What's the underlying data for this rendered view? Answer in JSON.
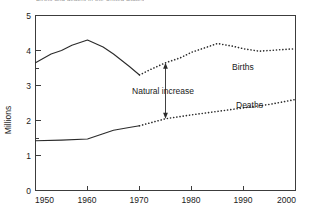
{
  "figure": {
    "cut_off_caption": "Births and deaths in the United States",
    "ylabel": "Millions"
  },
  "annotations": {
    "natural_increase": {
      "label": "Natural increase",
      "at_year": 1975,
      "from_value": 2.05,
      "to_value": 3.65
    }
  },
  "series_labels": {
    "births": "Births",
    "deaths": "Deaths"
  },
  "axis": {
    "y_ticks": [
      "0",
      "1",
      "2",
      "3",
      "4",
      "5"
    ],
    "x_ticks": [
      "1950",
      "1960",
      "1970",
      "1980",
      "1990",
      "2000"
    ]
  },
  "chart_data": {
    "type": "line",
    "title": "Births and deaths in the United States",
    "xlabel": "",
    "ylabel": "Millions",
    "xlim": [
      1950,
      2000
    ],
    "ylim": [
      0,
      5
    ],
    "y_ticks": [
      0,
      1,
      2,
      3,
      4,
      5
    ],
    "y_minor_ticks": [
      1.5,
      3.5
    ],
    "x_ticks": [
      1950,
      1960,
      1970,
      1980,
      1990,
      2000
    ],
    "grid": false,
    "legend": "inline-labels",
    "colors": {
      "line": "#2b2b2b",
      "axis": "#3c3c3c",
      "background": "#ffffff"
    },
    "series": [
      {
        "name": "Births",
        "style_historical": "solid",
        "style_projected": "dotted",
        "split_year": 1970,
        "x": [
          1950,
          1953,
          1955,
          1957,
          1960,
          1963,
          1965,
          1968,
          1970,
          1972,
          1975,
          1978,
          1980,
          1983,
          1985,
          1988,
          1990,
          1993,
          1995,
          2000
        ],
        "values": [
          3.65,
          3.9,
          4.0,
          4.15,
          4.3,
          4.1,
          3.9,
          3.55,
          3.3,
          3.45,
          3.65,
          3.8,
          3.95,
          4.1,
          4.2,
          4.12,
          4.05,
          3.98,
          4.0,
          4.05
        ]
      },
      {
        "name": "Deaths",
        "style_historical": "solid",
        "style_projected": "dotted",
        "split_year": 1970,
        "x": [
          1950,
          1955,
          1960,
          1963,
          1965,
          1968,
          1970,
          1975,
          1980,
          1985,
          1990,
          1995,
          2000
        ],
        "values": [
          1.42,
          1.44,
          1.47,
          1.62,
          1.72,
          1.8,
          1.85,
          2.05,
          2.16,
          2.26,
          2.36,
          2.46,
          2.6
        ]
      }
    ],
    "annotations": [
      {
        "text": "Natural increase",
        "x": 1975,
        "y_from": 2.05,
        "y_to": 3.65,
        "arrow": "double"
      }
    ]
  }
}
